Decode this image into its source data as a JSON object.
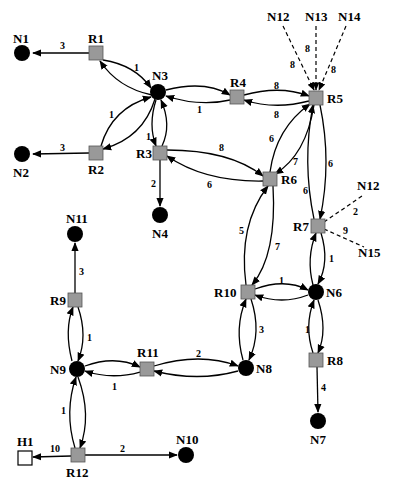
{
  "diagram": {
    "type": "network-topology",
    "colors": {
      "router_fill": "#999999",
      "node_fill": "#000000",
      "host_fill": "#ffffff",
      "edge": "#000000"
    },
    "nodes": [
      {
        "id": "N1",
        "label": "N1",
        "kind": "node",
        "x": 22,
        "y": 53,
        "lx": 6,
        "ly": 40
      },
      {
        "id": "N2",
        "label": "N2",
        "kind": "node",
        "x": 22,
        "y": 154,
        "lx": 8,
        "ly": 177
      },
      {
        "id": "N3",
        "label": "N3",
        "kind": "node",
        "x": 158,
        "y": 92,
        "lx": 152,
        "ly": 80
      },
      {
        "id": "N4",
        "label": "N4",
        "kind": "node",
        "x": 160,
        "y": 215,
        "lx": 152,
        "ly": 237
      },
      {
        "id": "N6",
        "label": "N6",
        "kind": "node",
        "x": 316,
        "y": 292,
        "lx": 326,
        "ly": 297
      },
      {
        "id": "N7",
        "label": "N7",
        "kind": "node",
        "x": 318,
        "y": 421,
        "lx": 310,
        "ly": 443
      },
      {
        "id": "N8",
        "label": "N8",
        "kind": "node",
        "x": 246,
        "y": 368,
        "lx": 256,
        "ly": 373
      },
      {
        "id": "N9",
        "label": "N9",
        "kind": "node",
        "x": 77,
        "y": 369,
        "lx": 50,
        "ly": 374
      },
      {
        "id": "N10",
        "label": "N10",
        "kind": "node",
        "x": 186,
        "y": 455,
        "lx": 176,
        "ly": 441
      },
      {
        "id": "N11",
        "label": "N11",
        "kind": "node",
        "x": 75,
        "y": 234,
        "lx": 66,
        "ly": 221
      },
      {
        "id": "R1",
        "label": "R1",
        "kind": "router",
        "x": 96,
        "y": 53,
        "lx": 88,
        "ly": 43
      },
      {
        "id": "R2",
        "label": "R2",
        "kind": "router",
        "x": 96,
        "y": 153,
        "lx": 88,
        "ly": 173
      },
      {
        "id": "R3",
        "label": "R3",
        "kind": "router",
        "x": 160,
        "y": 153,
        "lx": 136,
        "ly": 158
      },
      {
        "id": "R4",
        "label": "R4",
        "kind": "router",
        "x": 237,
        "y": 97,
        "lx": 231,
        "ly": 88
      },
      {
        "id": "R5",
        "label": "R5",
        "kind": "router",
        "x": 316,
        "y": 98,
        "lx": 327,
        "ly": 103
      },
      {
        "id": "R6",
        "label": "R6",
        "kind": "router",
        "x": 270,
        "y": 179,
        "lx": 281,
        "ly": 184
      },
      {
        "id": "R7",
        "label": "R7",
        "kind": "router",
        "x": 318,
        "y": 226,
        "lx": 293,
        "ly": 231
      },
      {
        "id": "R8",
        "label": "R8",
        "kind": "router",
        "x": 316,
        "y": 360,
        "lx": 327,
        "ly": 365
      },
      {
        "id": "R9",
        "label": "R9",
        "kind": "router",
        "x": 75,
        "y": 300,
        "lx": 50,
        "ly": 305
      },
      {
        "id": "R10",
        "label": "R10",
        "kind": "router",
        "x": 248,
        "y": 292,
        "lx": 214,
        "ly": 297
      },
      {
        "id": "R11",
        "label": "R11",
        "kind": "router",
        "x": 147,
        "y": 369,
        "lx": 137,
        "ly": 358
      },
      {
        "id": "R12",
        "label": "R12",
        "kind": "router",
        "x": 78,
        "y": 455,
        "lx": 66,
        "ly": 475
      },
      {
        "id": "H1",
        "label": "H1",
        "kind": "host",
        "x": 25,
        "y": 459,
        "lx": 17,
        "ly": 445
      }
    ],
    "external_labels": [
      {
        "id": "N12a",
        "label": "N12",
        "x": 75,
        "y": 21
      },
      {
        "id": "N13",
        "label": "N13",
        "x": 116,
        "y": 21
      },
      {
        "id": "N14",
        "label": "N14",
        "x": 147,
        "y": 21
      },
      {
        "id": "N12b",
        "label": "N12",
        "x": 357,
        "y": 190
      },
      {
        "id": "N15",
        "label": "N15",
        "x": 358,
        "y": 256
      }
    ],
    "edges": [
      {
        "from": "R1",
        "to": "N1",
        "weight": "3",
        "style": "solid",
        "directed": "one-way"
      },
      {
        "from": "R2",
        "to": "N2",
        "weight": "3",
        "style": "solid",
        "directed": "one-way"
      },
      {
        "from": "R1",
        "to": "N3",
        "weight": "1",
        "style": "solid",
        "directed": "two-way"
      },
      {
        "from": "R2",
        "to": "N3",
        "weight": "1",
        "style": "solid",
        "directed": "two-way"
      },
      {
        "from": "R3",
        "to": "N3",
        "weight": "1",
        "style": "solid",
        "directed": "two-way"
      },
      {
        "from": "N3",
        "to": "R4",
        "weight": "1",
        "style": "solid",
        "directed": "two-way"
      },
      {
        "from": "R4",
        "to": "R5",
        "weights": [
          "8",
          "8"
        ],
        "style": "solid",
        "directed": "two-way"
      },
      {
        "from": "R3",
        "to": "N4",
        "weight": "2",
        "style": "solid",
        "directed": "one-way"
      },
      {
        "from": "R3",
        "to": "R6",
        "weights": [
          "8",
          "6"
        ],
        "style": "solid",
        "directed": "two-way"
      },
      {
        "from": "R6",
        "to": "R5",
        "weights": [
          "6",
          "7"
        ],
        "style": "solid",
        "directed": "two-way"
      },
      {
        "from": "R5",
        "to": "R7",
        "weights": [
          "6",
          "6"
        ],
        "style": "solid",
        "directed": "two-way"
      },
      {
        "from": "R10",
        "to": "R6",
        "weights": [
          "5",
          "7"
        ],
        "style": "solid",
        "directed": "two-way"
      },
      {
        "from": "R7",
        "to": "N6",
        "weight": "1",
        "style": "solid",
        "directed": "two-way"
      },
      {
        "from": "R10",
        "to": "N6",
        "weight": "1",
        "style": "solid",
        "directed": "two-way"
      },
      {
        "from": "R10",
        "to": "N8",
        "weight": "3",
        "style": "solid",
        "directed": "two-way"
      },
      {
        "from": "N6",
        "to": "R8",
        "weight": "1",
        "style": "solid",
        "directed": "two-way"
      },
      {
        "from": "R8",
        "to": "N7",
        "weight": "4",
        "style": "solid",
        "directed": "one-way"
      },
      {
        "from": "R9",
        "to": "N11",
        "weight": "3",
        "style": "solid",
        "directed": "one-way"
      },
      {
        "from": "R9",
        "to": "N9",
        "weight": "1",
        "style": "solid",
        "directed": "two-way"
      },
      {
        "from": "N9",
        "to": "R11",
        "weight": "1",
        "style": "solid",
        "directed": "two-way"
      },
      {
        "from": "R11",
        "to": "N8",
        "weight": "2",
        "style": "solid",
        "directed": "two-way"
      },
      {
        "from": "N9",
        "to": "R12",
        "weight": "1",
        "style": "solid",
        "directed": "two-way"
      },
      {
        "from": "R12",
        "to": "H1",
        "weight": "10",
        "style": "solid",
        "directed": "one-way"
      },
      {
        "from": "R12",
        "to": "N10",
        "weight": "2",
        "style": "solid",
        "directed": "one-way"
      },
      {
        "from": "N12a",
        "to": "R5",
        "weight": "8",
        "style": "dashed",
        "directed": "one-way"
      },
      {
        "from": "N13",
        "to": "R5",
        "weight": "8",
        "style": "dashed",
        "directed": "one-way"
      },
      {
        "from": "N14",
        "to": "R5",
        "weight": "8",
        "style": "dashed",
        "directed": "one-way"
      },
      {
        "from": "R7",
        "to": "N12b",
        "weight": "2",
        "style": "dashed",
        "directed": "none"
      },
      {
        "from": "R7",
        "to": "N15",
        "weight": "9",
        "style": "dashed",
        "directed": "none"
      }
    ],
    "weight_labels": [
      {
        "text": "3",
        "x": 60,
        "y": 49
      },
      {
        "text": "3",
        "x": 60,
        "y": 151
      },
      {
        "text": "1",
        "x": 134,
        "y": 71
      },
      {
        "text": "1",
        "x": 109,
        "y": 118
      },
      {
        "text": "1",
        "x": 146,
        "y": 140
      },
      {
        "text": "1",
        "x": 197,
        "y": 113
      },
      {
        "text": "8",
        "x": 274,
        "y": 89
      },
      {
        "text": "8",
        "x": 274,
        "y": 118
      },
      {
        "text": "2",
        "x": 151,
        "y": 187
      },
      {
        "text": "8",
        "x": 219,
        "y": 151
      },
      {
        "text": "6",
        "x": 207,
        "y": 188
      },
      {
        "text": "6",
        "x": 269,
        "y": 142
      },
      {
        "text": "7",
        "x": 293,
        "y": 165
      },
      {
        "text": "6",
        "x": 328,
        "y": 167
      },
      {
        "text": "6",
        "x": 303,
        "y": 194
      },
      {
        "text": "8",
        "x": 290,
        "y": 68
      },
      {
        "text": "8",
        "x": 305,
        "y": 52
      },
      {
        "text": "8",
        "x": 331,
        "y": 73
      },
      {
        "text": "2",
        "x": 353,
        "y": 215
      },
      {
        "text": "9",
        "x": 343,
        "y": 234
      },
      {
        "text": "5",
        "x": 239,
        "y": 234
      },
      {
        "text": "7",
        "x": 275,
        "y": 250
      },
      {
        "text": "1",
        "x": 329,
        "y": 262
      },
      {
        "text": "1",
        "x": 279,
        "y": 284
      },
      {
        "text": "3",
        "x": 259,
        "y": 333
      },
      {
        "text": "1",
        "x": 305,
        "y": 333
      },
      {
        "text": "3",
        "x": 79,
        "y": 275
      },
      {
        "text": "1",
        "x": 87,
        "y": 341
      },
      {
        "text": "1",
        "x": 112,
        "y": 390
      },
      {
        "text": "2",
        "x": 196,
        "y": 357
      },
      {
        "text": "1",
        "x": 61,
        "y": 414
      },
      {
        "text": "4",
        "x": 321,
        "y": 391
      },
      {
        "text": "10",
        "x": 52,
        "y": 452
      },
      {
        "text": "2",
        "x": 120,
        "y": 452
      }
    ]
  }
}
